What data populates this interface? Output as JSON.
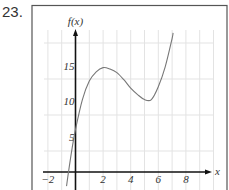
{
  "problem": {
    "number": "23."
  },
  "chart_data": {
    "type": "line",
    "title": "",
    "xlabel": "x",
    "ylabel": "f(x)",
    "xlim": [
      -2.3,
      9.8
    ],
    "ylim": [
      -2.5,
      21
    ],
    "grid": true,
    "x_ticks": [
      -2,
      2,
      4,
      6,
      8
    ],
    "x_tick_labels": [
      "−2",
      "2",
      "4",
      "6",
      "8"
    ],
    "y_ticks": [
      5,
      10,
      15
    ],
    "y_tick_labels": [
      "5",
      "10",
      "15"
    ],
    "series": [
      {
        "name": "f(x)",
        "description": "cubic with local max near (2, 14.7) and local min near (5, 10.2)",
        "x": [
          -0.65,
          -0.5,
          -0.25,
          0,
          0.5,
          1,
          1.5,
          2,
          2.5,
          3,
          3.5,
          4,
          4.5,
          5,
          5.5,
          6,
          6.5,
          7,
          7.07
        ],
        "y": [
          -2.0,
          0.1,
          3.3,
          6.0,
          10.2,
          12.8,
          14.1,
          14.7,
          14.5,
          14.0,
          13.0,
          11.8,
          10.9,
          10.2,
          10.2,
          12.0,
          14.8,
          18.8,
          19.6
        ]
      }
    ],
    "annotations": [
      "local maximum near x = 2",
      "local minimum near x = 5"
    ]
  }
}
